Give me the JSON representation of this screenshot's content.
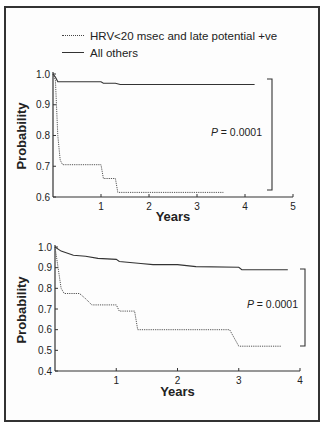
{
  "legend": {
    "items": [
      {
        "label": "HRV<20 msec and late potential +ve",
        "style": "dotted"
      },
      {
        "label": "All others",
        "style": "solid"
      }
    ]
  },
  "chart_data": [
    {
      "type": "line",
      "subtype": "kaplan-meier",
      "title": "",
      "xlabel": "Years",
      "ylabel": "Probability",
      "xlim": [
        0,
        5
      ],
      "ylim": [
        0.6,
        1.0
      ],
      "xticks": [
        "1",
        "2",
        "3",
        "4",
        "5"
      ],
      "yticks": [
        "0.6",
        "0.7",
        "0.8",
        "0.9",
        "1.0"
      ],
      "grid": false,
      "annotation": "P = 0.0001",
      "series": [
        {
          "name": "HRV<20 msec and late potential +ve",
          "style": "dotted",
          "x": [
            0,
            0.05,
            0.1,
            0.15,
            0.2,
            1.0,
            1.05,
            1.3,
            1.35,
            3.55
          ],
          "y": [
            1.0,
            0.98,
            0.8,
            0.72,
            0.705,
            0.705,
            0.66,
            0.66,
            0.615,
            0.615
          ]
        },
        {
          "name": "All others",
          "style": "solid",
          "x": [
            0,
            0.05,
            0.1,
            1.0,
            1.05,
            1.3,
            1.4,
            4.2
          ],
          "y": [
            1.0,
            0.99,
            0.975,
            0.975,
            0.97,
            0.97,
            0.966,
            0.966
          ]
        }
      ]
    },
    {
      "type": "line",
      "subtype": "kaplan-meier",
      "title": "",
      "xlabel": "Years",
      "ylabel": "Probability",
      "xlim": [
        0,
        4
      ],
      "ylim": [
        0.4,
        1.0
      ],
      "xticks": [
        "1",
        "2",
        "3",
        "4"
      ],
      "yticks": [
        "0.4",
        "0.5",
        "0.6",
        "0.7",
        "0.8",
        "0.9",
        "1.0"
      ],
      "grid": false,
      "annotation": "P = 0.0001",
      "series": [
        {
          "name": "HRV<20 msec and late potential +ve",
          "style": "dotted",
          "x": [
            0,
            0.05,
            0.1,
            0.15,
            0.4,
            0.5,
            0.6,
            1.0,
            1.05,
            1.3,
            1.35,
            2.85,
            3.0,
            3.7
          ],
          "y": [
            1.0,
            0.9,
            0.8,
            0.775,
            0.775,
            0.75,
            0.72,
            0.72,
            0.69,
            0.69,
            0.6,
            0.6,
            0.52,
            0.52
          ]
        },
        {
          "name": "All others",
          "style": "solid",
          "x": [
            0,
            0.1,
            0.3,
            0.5,
            0.7,
            1.0,
            1.05,
            1.4,
            1.6,
            2.0,
            2.3,
            3.0,
            3.05,
            3.8
          ],
          "y": [
            1.0,
            0.98,
            0.96,
            0.955,
            0.945,
            0.94,
            0.93,
            0.92,
            0.915,
            0.915,
            0.905,
            0.902,
            0.89,
            0.89
          ]
        }
      ]
    }
  ]
}
